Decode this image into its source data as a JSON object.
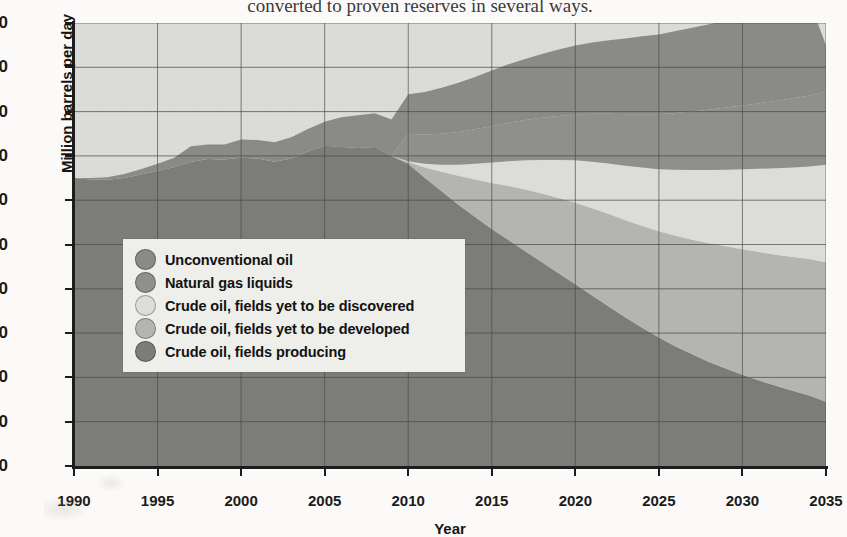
{
  "caption": {
    "text": "converted to proven reserves in several ways."
  },
  "axes": {
    "ylabel": "Million barrels per day",
    "xlabel": "Year",
    "yticks": [
      0,
      10,
      20,
      30,
      40,
      50,
      60,
      70,
      80,
      90,
      100
    ],
    "xticks": [
      1990,
      1995,
      2000,
      2005,
      2010,
      2015,
      2020,
      2025,
      2030,
      2035
    ]
  },
  "legend": {
    "items": [
      {
        "label": "Unconventional oil",
        "color": "#8a8a86"
      },
      {
        "label": "Natural gas liquids",
        "color": "#8f8f8b"
      },
      {
        "label": "Crude oil, fields yet to be discovered",
        "color": "#dcdcd8"
      },
      {
        "label": "Crude oil, fields yet to be developed",
        "color": "#b4b4b0"
      },
      {
        "label": "Crude oil, fields producing",
        "color": "#7c7c78"
      }
    ]
  },
  "colors": {
    "plot_background": "#dededa",
    "gridline": "#4a4a46",
    "axis": "#1d1d1d",
    "page_background": "#fbfaf8",
    "legend_background": "#eeeeea"
  },
  "chart_data": {
    "type": "area",
    "title": "",
    "subtitle": "",
    "xlabel": "Year",
    "ylabel": "Million barrels per day",
    "xlim": [
      1990,
      2035
    ],
    "ylim": [
      0,
      100
    ],
    "grid": true,
    "stacked": true,
    "legend_position": "inside-left",
    "x": [
      1990,
      1991,
      1992,
      1993,
      1994,
      1995,
      1996,
      1997,
      1998,
      1999,
      2000,
      2001,
      2002,
      2003,
      2004,
      2005,
      2006,
      2007,
      2008,
      2009,
      2010,
      2011,
      2012,
      2013,
      2014,
      2015,
      2016,
      2017,
      2018,
      2019,
      2020,
      2021,
      2022,
      2023,
      2024,
      2025,
      2026,
      2027,
      2028,
      2029,
      2030,
      2031,
      2032,
      2033,
      2034,
      2035
    ],
    "series": [
      {
        "name": "Crude oil, fields producing",
        "values": [
          65.0,
          64.7,
          64.6,
          65.0,
          65.8,
          66.6,
          67.5,
          68.6,
          69.3,
          69.2,
          69.6,
          69.4,
          68.7,
          69.4,
          71.0,
          72.3,
          72.0,
          71.8,
          72.0,
          70.0,
          68.2,
          65.0,
          62.0,
          59.0,
          56.2,
          53.5,
          51.0,
          48.5,
          46.0,
          43.5,
          41.0,
          38.5,
          36.0,
          33.5,
          31.2,
          29.0,
          27.0,
          25.2,
          23.5,
          22.0,
          20.6,
          19.3,
          18.1,
          17.0,
          15.9,
          14.5
        ]
      },
      {
        "name": "Crude oil, fields yet to be developed",
        "values": [
          0,
          0,
          0,
          0,
          0,
          0,
          0,
          0,
          0,
          0,
          0,
          0,
          0,
          0,
          0,
          0,
          0,
          0,
          0,
          0,
          0.4,
          2.4,
          4.4,
          6.5,
          8.5,
          10.4,
          12.2,
          13.9,
          15.5,
          17.0,
          18.4,
          19.7,
          20.9,
          22.0,
          23.0,
          24.0,
          25.0,
          25.9,
          26.8,
          27.6,
          28.3,
          29.0,
          29.6,
          30.2,
          30.8,
          31.5
        ]
      },
      {
        "name": "Crude oil, fields yet to be discovered",
        "values": [
          0,
          0,
          0,
          0,
          0,
          0,
          0,
          0,
          0,
          0,
          0,
          0,
          0,
          0,
          0,
          0,
          0,
          0,
          0,
          0,
          0.2,
          0.8,
          1.6,
          2.5,
          3.5,
          4.6,
          5.6,
          6.6,
          7.6,
          8.6,
          9.6,
          10.5,
          11.4,
          12.3,
          13.2,
          14.0,
          14.9,
          15.7,
          16.5,
          17.3,
          18.1,
          18.8,
          19.5,
          20.2,
          20.9,
          22.0
        ]
      },
      {
        "name": "Natural gas liquids",
        "values": [
          0,
          0,
          0,
          0,
          0,
          0,
          0,
          0,
          0,
          0,
          0,
          0,
          0,
          0,
          0,
          0,
          0,
          0,
          0,
          0,
          6.2,
          6.6,
          7.0,
          7.4,
          7.8,
          8.2,
          8.7,
          9.1,
          9.5,
          9.9,
          10.3,
          10.8,
          11.2,
          11.6,
          12.0,
          12.4,
          12.8,
          13.2,
          13.6,
          14.0,
          14.4,
          14.8,
          15.2,
          15.6,
          16.0,
          16.5
        ]
      },
      {
        "name": "Unconventional oil",
        "values": [
          0,
          0.3,
          0.6,
          0.9,
          1.2,
          1.6,
          2.1,
          3.6,
          3.3,
          3.4,
          4.1,
          4.2,
          4.4,
          4.8,
          5.1,
          5.4,
          6.7,
          7.4,
          7.6,
          8.2,
          8.9,
          9.6,
          10.4,
          11.1,
          11.8,
          12.6,
          13.2,
          13.8,
          14.4,
          15.0,
          15.6,
          16.1,
          16.6,
          17.1,
          17.6,
          18.0,
          18.5,
          18.9,
          19.3,
          19.7,
          20.1,
          20.5,
          20.8,
          21.1,
          21.4,
          10.5
        ]
      }
    ],
    "boundaries_note": "Stacked totals rise from about 65 in 1990 to about 95 in 2035.",
    "totals": [
      65,
      65,
      65.2,
      65.9,
      67,
      68.2,
      69.6,
      72.2,
      72.6,
      72.6,
      73.7,
      73.6,
      73.1,
      74.2,
      76.1,
      77.7,
      78.7,
      79.2,
      79.6,
      78.2,
      83.9,
      84.4,
      85.4,
      86.5,
      87.8,
      89.3,
      90.7,
      91.9,
      93.0,
      94.0,
      94.9,
      95.6,
      96.1,
      96.5,
      97.0,
      97.4,
      98.2,
      98.9,
      99.7,
      100.6,
      101.5,
      102.4,
      103.2,
      104.1,
      105.0,
      95.0
    ]
  }
}
